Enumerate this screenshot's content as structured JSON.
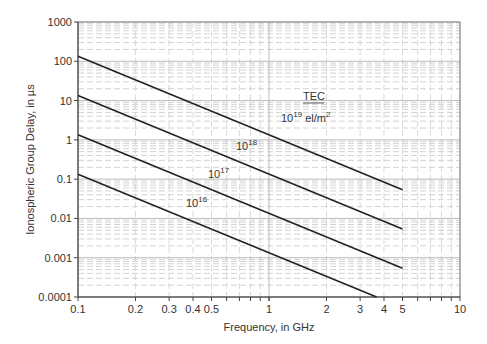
{
  "chart_data": {
    "type": "line",
    "title": "",
    "xlabel": "Frequency, in GHz",
    "ylabel": "Ionospheric Group Delay, in µs",
    "xscale": "log",
    "yscale": "log",
    "xlim": [
      0.1,
      10
    ],
    "ylim": [
      0.0001,
      1000
    ],
    "grid": true,
    "x_ticks": [
      "0.1",
      "0.2",
      "0.3",
      "0.4",
      "0.5",
      "1",
      "2",
      "3",
      "4",
      "5",
      "10"
    ],
    "y_ticks": [
      "1000",
      "100",
      "10",
      "1",
      "0.1",
      "0.01",
      "0.001",
      "0.0001"
    ],
    "legend_title": "TEC",
    "series": [
      {
        "name": "10^19 el/m^2",
        "label_base": "10",
        "label_exp": "19",
        "label_unit": " el/m",
        "label_unit_exp": "2",
        "x": [
          0.1,
          5
        ],
        "y": [
          134,
          0.0536
        ]
      },
      {
        "name": "10^18",
        "label_base": "10",
        "label_exp": "18",
        "x": [
          0.1,
          5
        ],
        "y": [
          13.4,
          0.00536
        ]
      },
      {
        "name": "10^17",
        "label_base": "10",
        "label_exp": "17",
        "x": [
          0.1,
          5
        ],
        "y": [
          1.34,
          0.000536
        ]
      },
      {
        "name": "10^16",
        "label_base": "10",
        "label_exp": "16",
        "x": [
          0.1,
          3.66
        ],
        "y": [
          0.134,
          0.0001
        ]
      }
    ]
  }
}
